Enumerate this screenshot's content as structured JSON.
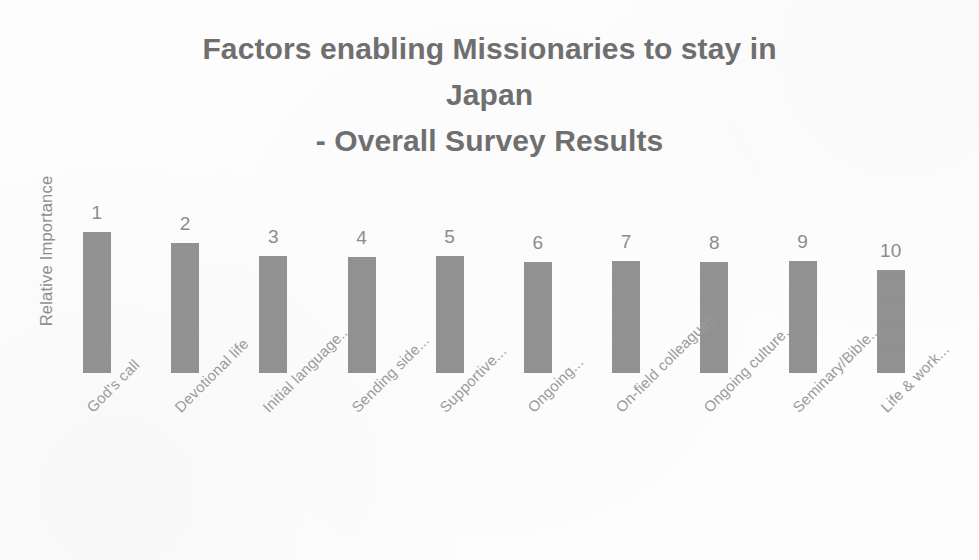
{
  "chart_data": {
    "type": "bar",
    "title": "Factors enabling Missionaries to stay in Japan - Overall Survey Results",
    "title_lines": [
      "Factors enabling Missionaries to stay in",
      "Japan",
      "- Overall Survey Results"
    ],
    "xlabel": "",
    "ylabel": "Relative Importance",
    "grid": false,
    "legend": "none",
    "ylim": [
      0,
      150
    ],
    "bar_color": "#8d8d8d",
    "text_color": "#6f6f6f",
    "axis_text_color": "#9a9a9a",
    "categories": [
      "God's call",
      "Devotional life",
      "Initial language...",
      "Sending side...",
      "Supportive...",
      "Ongoing...",
      "On-field colleagues",
      "Ongoing culture...",
      "Seminary/Bible...",
      "Life & work..."
    ],
    "values": [
      141,
      130,
      117,
      116,
      117,
      111,
      112,
      111,
      112,
      103
    ],
    "point_labels": [
      "1",
      "2",
      "3",
      "4",
      "5",
      "6",
      "7",
      "8",
      "9",
      "10"
    ],
    "annotations": []
  }
}
